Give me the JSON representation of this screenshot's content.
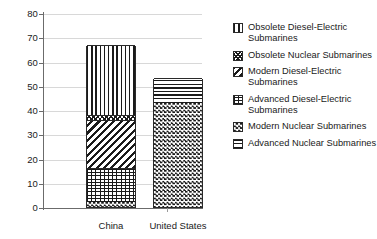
{
  "chart_data": {
    "type": "bar",
    "subtype": "stacked-bar",
    "title": "",
    "xlabel": "",
    "ylabel": "",
    "ylim": [
      0,
      80
    ],
    "yticks": [
      0,
      10,
      20,
      30,
      40,
      50,
      60,
      70,
      80
    ],
    "ytick_labels": [
      "0",
      "10",
      "20",
      "30",
      "40",
      "50",
      "60",
      "70",
      "80"
    ],
    "grid": true,
    "legend_position": "right",
    "categories": [
      "China",
      "United States"
    ],
    "series": [
      {
        "name": "Modern Nuclear Submarines",
        "pattern": "checker",
        "values": [
          2,
          43
        ]
      },
      {
        "name": "Advanced Diesel-Electric Submarines",
        "pattern": "grid",
        "values": [
          14,
          0
        ]
      },
      {
        "name": "Modern Diesel-Electric Submarines",
        "pattern": "diag",
        "values": [
          20,
          0
        ]
      },
      {
        "name": "Obsolete Nuclear Submarines",
        "pattern": "diagcheck",
        "values": [
          2,
          0
        ]
      },
      {
        "name": "Obsolete Diesel-Electric Submarines",
        "pattern": "vert",
        "values": [
          29,
          0
        ]
      },
      {
        "name": "Advanced Nuclear Submarines",
        "pattern": "horiz",
        "values": [
          0,
          10
        ]
      }
    ],
    "totals": [
      67,
      53
    ]
  },
  "axes": {
    "y_ticks": [
      {
        "label": "80",
        "value": 80
      },
      {
        "label": "70",
        "value": 70
      },
      {
        "label": "60",
        "value": 60
      },
      {
        "label": "50",
        "value": 50
      },
      {
        "label": "40",
        "value": 40
      },
      {
        "label": "30",
        "value": 30
      },
      {
        "label": "20",
        "value": 20
      },
      {
        "label": "10",
        "value": 10
      },
      {
        "label": "0",
        "value": 0
      }
    ],
    "x_labels": [
      "China",
      "United States"
    ]
  },
  "legend": {
    "items": [
      {
        "label": "Obsolete Diesel-Electric Submarines",
        "pattern": "vert"
      },
      {
        "label": "Obsolete Nuclear Submarines",
        "pattern": "diagcheck"
      },
      {
        "label": "Modern Diesel-Electric Submarines",
        "pattern": "diag"
      },
      {
        "label": "Advanced Diesel-Electric Submarines",
        "pattern": "grid"
      },
      {
        "label": "Modern Nuclear Submarines",
        "pattern": "checker"
      },
      {
        "label": "Advanced Nuclear Submarines",
        "pattern": "horiz"
      }
    ]
  },
  "colors": {
    "ink": "#1a1a1a",
    "axis": "#6b6b6b",
    "grid": "#d8d8d8",
    "background": "#ffffff"
  }
}
